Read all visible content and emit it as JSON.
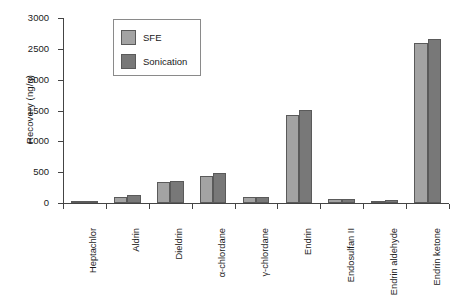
{
  "chart_data": {
    "type": "bar",
    "title": "",
    "subtitle": "",
    "xlabel": "",
    "ylabel": "Recovery (ng/g)",
    "ylim": [
      0,
      3000
    ],
    "yticks": [
      0,
      500,
      1000,
      1500,
      2000,
      2500,
      3000
    ],
    "ytick_labels": [
      "0",
      "500",
      "1000",
      "1500",
      "2000",
      "2500",
      "3000"
    ],
    "grid": false,
    "legend_position": "upper-left-inside",
    "categories": [
      "Heptachlor",
      "Aldrin",
      "Dieldrin",
      "α-chlordane",
      "γ-chlordane",
      "Endrin",
      "Endosulfan II",
      "Endrin aldehyde",
      "Endrin ketone"
    ],
    "series": [
      {
        "name": "SFE",
        "color": "#a3a3a3",
        "values": [
          20,
          100,
          340,
          440,
          100,
          1430,
          60,
          40,
          2590
        ]
      },
      {
        "name": "Sonication",
        "color": "#787878",
        "values": [
          25,
          130,
          360,
          490,
          105,
          1515,
          65,
          45,
          2660
        ]
      }
    ]
  },
  "legend": {
    "entries": [
      {
        "label": "SFE"
      },
      {
        "label": "Sonication"
      }
    ]
  },
  "colors": {
    "sfe": "#a3a3a3",
    "sonication": "#787878",
    "axis": "#444444",
    "bar_outline": "#5a5a5a",
    "background": "#ffffff"
  }
}
